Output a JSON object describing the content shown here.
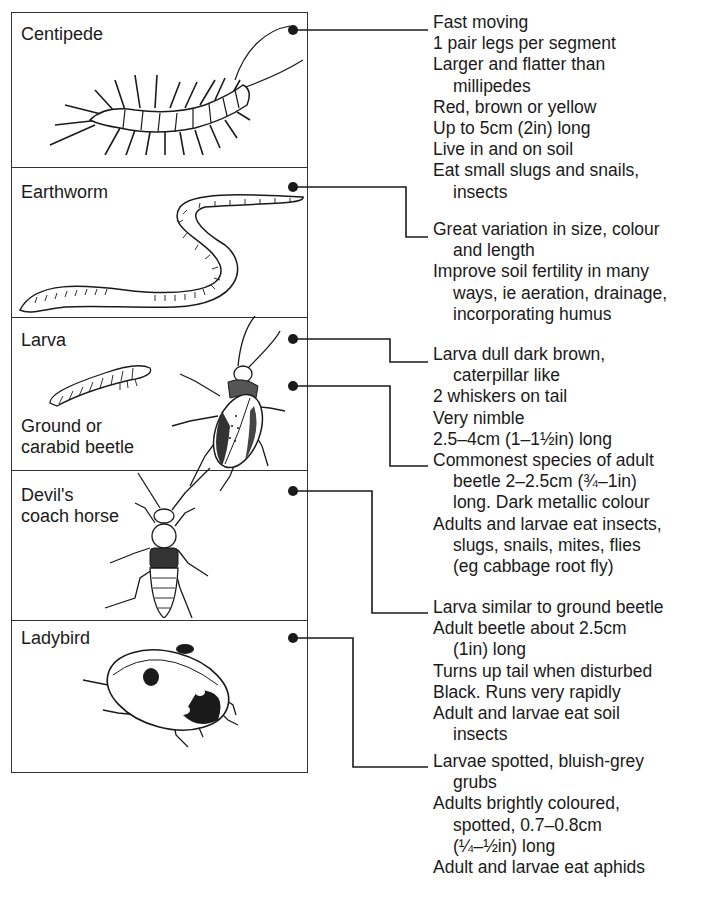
{
  "figure": {
    "colors": {
      "ink": "#1a1a1a",
      "background": "#ffffff",
      "frame": "#333333"
    },
    "panels": [
      {
        "id": "centipede",
        "label_lines": [
          "Centipede"
        ]
      },
      {
        "id": "earthworm",
        "label_lines": [
          "Earthworm"
        ]
      },
      {
        "id": "larva-beetle",
        "label_lines": [
          "Larva"
        ],
        "sublabel_lines": [
          "Ground or",
          "carabid beetle"
        ]
      },
      {
        "id": "devils-coach-horse",
        "label_lines": [
          "Devil's",
          "coach horse"
        ]
      },
      {
        "id": "ladybird",
        "label_lines": [
          "Ladybird"
        ]
      }
    ],
    "notes": [
      {
        "id": "centipede",
        "lines": [
          {
            "text": "Fast moving",
            "indent": false
          },
          {
            "text": "1 pair legs per segment",
            "indent": false
          },
          {
            "text": "Larger and flatter than",
            "indent": false
          },
          {
            "text": "millipedes",
            "indent": true
          },
          {
            "text": "Red, brown or yellow",
            "indent": false
          },
          {
            "text": "Up to 5cm (2in) long",
            "indent": false
          },
          {
            "text": "Live in and on soil",
            "indent": false
          },
          {
            "text": "Eat small slugs and snails,",
            "indent": false
          },
          {
            "text": "insects",
            "indent": true
          }
        ]
      },
      {
        "id": "earthworm",
        "lines": [
          {
            "text": "Great variation in size, colour",
            "indent": false
          },
          {
            "text": "and length",
            "indent": true
          },
          {
            "text": "Improve soil fertility in many",
            "indent": false
          },
          {
            "text": "ways, ie aeration, drainage,",
            "indent": true
          },
          {
            "text": "incorporating humus",
            "indent": true
          }
        ]
      },
      {
        "id": "larva",
        "lines": [
          {
            "text": "Larva dull dark brown,",
            "indent": false
          },
          {
            "text": "caterpillar like",
            "indent": true
          },
          {
            "text": "2 whiskers on tail",
            "indent": false
          },
          {
            "text": "Very nimble",
            "indent": false
          },
          {
            "text": "2.5–4cm (1–1½in) long",
            "indent": false
          }
        ]
      },
      {
        "id": "ground-beetle",
        "lines": [
          {
            "text": "Commonest species of adult",
            "indent": false
          },
          {
            "text": "beetle 2–2.5cm (¾–1in)",
            "indent": true
          },
          {
            "text": "long. Dark metallic colour",
            "indent": true
          },
          {
            "text": "Adults and larvae eat insects,",
            "indent": false
          },
          {
            "text": "slugs, snails, mites, flies",
            "indent": true
          },
          {
            "text": "(eg cabbage root fly)",
            "indent": true
          }
        ]
      },
      {
        "id": "devils-coach-horse",
        "lines": [
          {
            "text": "Larva similar to ground beetle",
            "indent": false
          },
          {
            "text": "Adult beetle about 2.5cm",
            "indent": false
          },
          {
            "text": "(1in) long",
            "indent": true
          },
          {
            "text": "Turns up tail when disturbed",
            "indent": false
          },
          {
            "text": "Black. Runs very rapidly",
            "indent": false
          },
          {
            "text": "Adult and larvae eat soil",
            "indent": false
          },
          {
            "text": "insects",
            "indent": true
          }
        ]
      },
      {
        "id": "ladybird",
        "lines": [
          {
            "text": "Larvae spotted, bluish-grey",
            "indent": false
          },
          {
            "text": "grubs",
            "indent": true
          },
          {
            "text": "Adults brightly coloured,",
            "indent": false
          },
          {
            "text": "spotted, 0.7–0.8cm",
            "indent": true
          },
          {
            "text": "(¼–½in) long",
            "indent": true
          },
          {
            "text": "Adult and larvae eat aphids",
            "indent": false
          }
        ]
      }
    ],
    "icons": [
      "centipede-illustration",
      "earthworm-illustration",
      "larva-illustration",
      "ground-beetle-illustration",
      "devils-coach-horse-illustration",
      "ladybird-illustration",
      "leader-dot"
    ]
  }
}
